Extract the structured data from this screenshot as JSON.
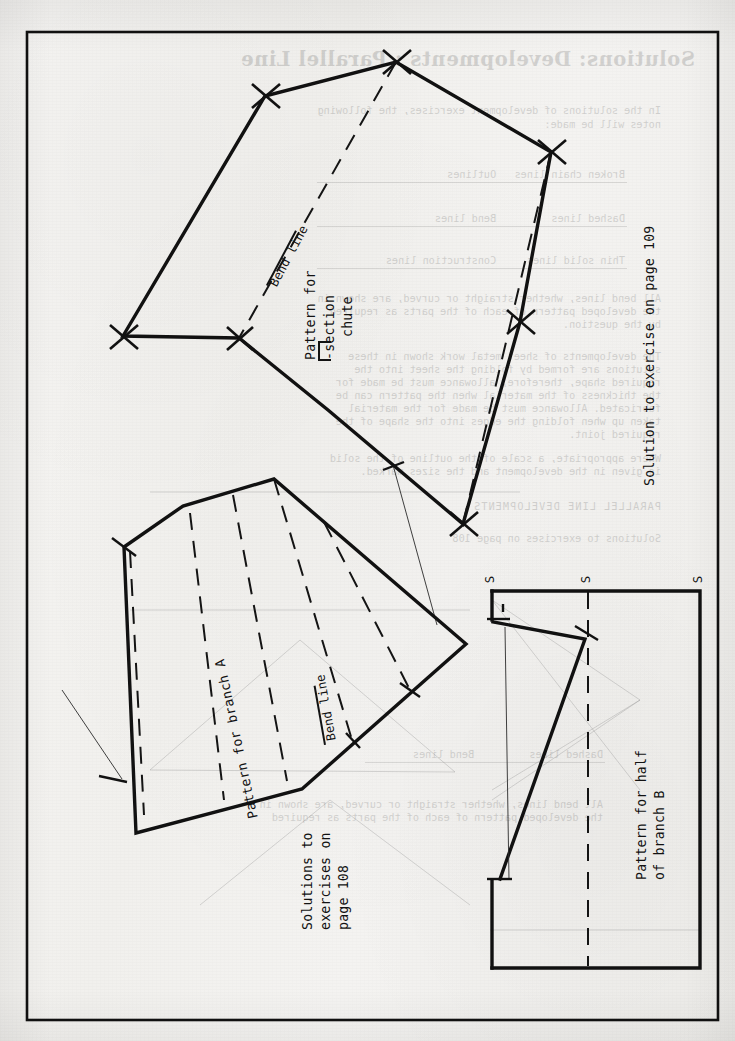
{
  "page": {
    "width": 735,
    "height": 1041,
    "paper_color": "#f2f1ee",
    "ink_color": "#111111",
    "orientation_note": "landscape drawing rotated 90 degrees counter-clockwise"
  },
  "captions": {
    "solution_109": "Solution to exercise on page 109",
    "solutions_108_line1": "Solutions to",
    "solutions_108_line2": "exercises on",
    "solutions_108_line3": "page 108",
    "pattern_chute_line1": "Pattern for",
    "pattern_chute_line2": "-section",
    "pattern_chute_line3": "chute",
    "pattern_branch_a": "Pattern for branch A",
    "pattern_branch_b_line1": "Pattern for half",
    "pattern_branch_b_line2": "of branch B",
    "bend_line_top": "Bend line",
    "bend_line_mid": "Bend line",
    "station_label": "S"
  },
  "station_labels": [
    "S",
    "S",
    "S"
  ],
  "ghost_text": {
    "title": "Solutions: Developments : Parallel Line",
    "lines": [
      "In the solutions of development exercises, the following",
      "notes will be made:",
      "Broken chain lines   Outlines",
      "Dashed lines         Bend lines",
      "Thin solid lines     Construction lines",
      "All bend lines, whether straight or curved, are shown in",
      "the developed pattern of each of the parts as required",
      "by the question.",
      "The developments of sheet metal work shown in these",
      "solutions are formed by folding the sheet into the",
      "required shape, therefore, allowance must be made for",
      "the thickness of the material when the pattern can be",
      "fabricated. Allowance must be made for the material",
      "taken up when folding the edges into the shape of the",
      "required joint.",
      "Where appropriate, a scale of the outline of the solid",
      "is given in the development and the sizes marked.",
      "PARALLEL LINE DEVELOPMENTS",
      "Solutions to exercises on page 108"
    ]
  },
  "figures": [
    {
      "name": "pattern-for-section-chute",
      "kind": "polygon-pattern",
      "label": "Pattern for ⌐-section chute",
      "bend_lines": 2,
      "vertex_ticks": 6
    },
    {
      "name": "pattern-for-branch-a",
      "kind": "polygon-pattern",
      "label": "Pattern for branch A",
      "bend_lines": 4,
      "vertex_ticks": 4
    },
    {
      "name": "pattern-for-half-of-branch-b",
      "kind": "rectangular-pattern",
      "label": "Pattern for half of branch B",
      "bend_lines": 1,
      "vertex_ticks": 2
    }
  ]
}
